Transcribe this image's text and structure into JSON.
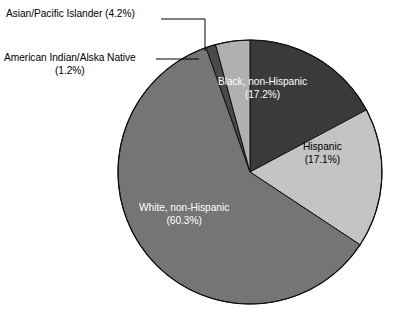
{
  "chart_data": {
    "type": "pie",
    "title": "",
    "subtitle": "",
    "xlabel": "",
    "ylabel": "",
    "legend_position": "none",
    "grid": false,
    "units": "percent",
    "total": 100.0,
    "start_angle_deg": 0,
    "direction": "clockwise",
    "categories": [
      "Black, non-Hispanic",
      "Hispanic",
      "White, non-Hispanic",
      "American Indian/Alska Native",
      "Asian/Pacific Islander"
    ],
    "values": [
      17.2,
      17.1,
      60.3,
      1.2,
      4.2
    ],
    "slices": [
      {
        "name": "Black, non-Hispanic",
        "value": 17.2,
        "value_text": "(17.2%)",
        "label_line1": "Black, non-Hispanic",
        "label_line2": "(17.2%)",
        "color": "#3a3a3a",
        "label_placement": "inside",
        "label_color": "#ffffff"
      },
      {
        "name": "Hispanic",
        "value": 17.1,
        "value_text": "(17.1%)",
        "label_line1": "Hispanic",
        "label_line2": "(17.1%)",
        "color": "#c4c4c4",
        "label_placement": "inside",
        "label_color": "#000000"
      },
      {
        "name": "White, non-Hispanic",
        "value": 60.3,
        "value_text": "(60.3%)",
        "label_line1": "White, non-Hispanic",
        "label_line2": "(60.3%)",
        "color": "#757575",
        "label_placement": "inside",
        "label_color": "#ffffff"
      },
      {
        "name": "American Indian/Alska Native",
        "value": 1.2,
        "value_text": "(1.2%)",
        "label_line1": "American Indian/Alska Native",
        "label_line2": "(1.2%)",
        "color": "#4a4a4a",
        "label_placement": "callout",
        "label_color": "#000000"
      },
      {
        "name": "Asian/Pacific Islander",
        "value": 4.2,
        "value_text": "(4.2%)",
        "label_line1": "Asian/Pacific Islander (4.2%)",
        "label_line2": "",
        "color": "#b0b0b0",
        "label_placement": "callout",
        "label_color": "#000000"
      }
    ]
  },
  "geometry": {
    "center_x": 250,
    "center_y": 172,
    "radius": 132,
    "outline_color": "#000000"
  }
}
